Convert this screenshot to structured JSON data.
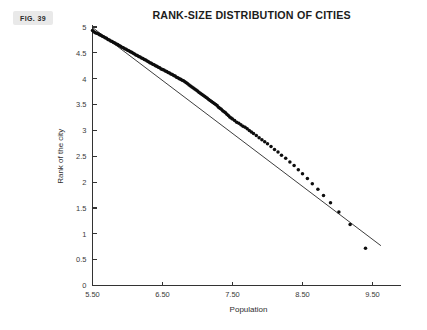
{
  "figure": {
    "badge_label": "FIG. 39"
  },
  "chart_data": {
    "type": "scatter",
    "title": "RANK-SIZE DISTRIBUTION OF CITIES",
    "xlabel": "Population",
    "ylabel": "Rank of the city",
    "xlim": [
      5.5,
      9.9
    ],
    "ylim": [
      0,
      5
    ],
    "grid": false,
    "legend": null,
    "xticks": [
      5.5,
      6.5,
      7.5,
      8.5,
      9.5
    ],
    "xtick_labels": [
      "5.50",
      "6.50",
      "7.50",
      "8.50",
      "9.50"
    ],
    "yticks": [
      0,
      0.5,
      1,
      1.5,
      2,
      2.5,
      3,
      3.5,
      4,
      4.5,
      5
    ],
    "ytick_labels": [
      "0",
      "0.5",
      "1",
      "1.5",
      "2",
      "2.5",
      "3",
      "3.5",
      "4",
      "4.5",
      "5"
    ],
    "marker_color": "#0d0d0d",
    "marker_size": 1.75,
    "fit_line": {
      "name": "least-squares fit",
      "color": "#1a1a1a",
      "x": [
        5.5,
        9.62
      ],
      "y": [
        4.99,
        0.77
      ]
    },
    "series": [
      {
        "name": "cities",
        "x": [
          5.5,
          5.52,
          5.54,
          5.56,
          5.58,
          5.6,
          5.62,
          5.64,
          5.66,
          5.68,
          5.7,
          5.72,
          5.74,
          5.76,
          5.78,
          5.8,
          5.82,
          5.84,
          5.86,
          5.88,
          5.9,
          5.92,
          5.94,
          5.96,
          5.98,
          6.0,
          6.02,
          6.04,
          6.06,
          6.08,
          6.1,
          6.12,
          6.14,
          6.16,
          6.18,
          6.2,
          6.22,
          6.24,
          6.26,
          6.28,
          6.3,
          6.32,
          6.34,
          6.36,
          6.38,
          6.4,
          6.42,
          6.44,
          6.46,
          6.48,
          6.5,
          6.52,
          6.54,
          6.56,
          6.58,
          6.6,
          6.62,
          6.64,
          6.66,
          6.68,
          6.7,
          6.72,
          6.74,
          6.76,
          6.78,
          6.8,
          6.82,
          6.84,
          6.86,
          6.88,
          6.9,
          6.92,
          6.94,
          6.96,
          6.98,
          7.0,
          7.02,
          7.04,
          7.06,
          7.08,
          7.1,
          7.12,
          7.14,
          7.16,
          7.18,
          7.2,
          7.22,
          7.24,
          7.26,
          7.28,
          7.3,
          7.32,
          7.34,
          7.36,
          7.38,
          7.4,
          7.42,
          7.44,
          7.46,
          7.48,
          7.5,
          7.53,
          7.56,
          7.59,
          7.62,
          7.65,
          7.68,
          7.71,
          7.74,
          7.77,
          7.8,
          7.84,
          7.88,
          7.92,
          7.96,
          8.0,
          8.05,
          8.1,
          8.15,
          8.2,
          8.26,
          8.32,
          8.38,
          8.44,
          8.5,
          8.57,
          8.64,
          8.72,
          8.8,
          8.9,
          9.02,
          9.18,
          9.4
        ],
        "y": [
          4.93,
          4.91,
          4.89,
          4.88,
          4.87,
          4.85,
          4.84,
          4.82,
          4.81,
          4.79,
          4.78,
          4.76,
          4.75,
          4.73,
          4.72,
          4.7,
          4.69,
          4.67,
          4.66,
          4.64,
          4.63,
          4.61,
          4.6,
          4.58,
          4.57,
          4.55,
          4.54,
          4.52,
          4.51,
          4.49,
          4.48,
          4.46,
          4.45,
          4.43,
          4.42,
          4.4,
          4.39,
          4.37,
          4.36,
          4.34,
          4.33,
          4.31,
          4.3,
          4.28,
          4.27,
          4.25,
          4.24,
          4.22,
          4.21,
          4.19,
          4.18,
          4.17,
          4.15,
          4.14,
          4.12,
          4.11,
          4.09,
          4.08,
          4.06,
          4.05,
          4.03,
          4.02,
          4.0,
          3.99,
          3.97,
          3.96,
          3.94,
          3.92,
          3.9,
          3.88,
          3.86,
          3.84,
          3.82,
          3.8,
          3.78,
          3.76,
          3.74,
          3.72,
          3.7,
          3.68,
          3.66,
          3.64,
          3.62,
          3.6,
          3.58,
          3.56,
          3.54,
          3.52,
          3.5,
          3.48,
          3.45,
          3.43,
          3.41,
          3.38,
          3.36,
          3.34,
          3.31,
          3.29,
          3.26,
          3.24,
          3.22,
          3.19,
          3.16,
          3.14,
          3.11,
          3.08,
          3.06,
          3.03,
          3.0,
          2.97,
          2.94,
          2.9,
          2.86,
          2.82,
          2.78,
          2.74,
          2.69,
          2.63,
          2.58,
          2.52,
          2.46,
          2.39,
          2.32,
          2.24,
          2.16,
          2.07,
          1.97,
          1.86,
          1.74,
          1.6,
          1.42,
          1.18,
          0.72
        ]
      }
    ]
  }
}
